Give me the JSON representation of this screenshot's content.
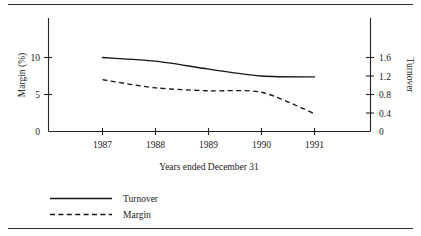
{
  "chart_data": {
    "type": "line",
    "title": "",
    "xlabel": "Years ended December 31",
    "categories": [
      "1987",
      "1988",
      "1989",
      "1990",
      "1991"
    ],
    "grid": false,
    "legend_position": "bottom-left",
    "axes": {
      "left": {
        "label": "Margin (%)",
        "ticks": [
          "0",
          "5",
          "10"
        ],
        "tick_values": [
          0,
          5,
          10
        ],
        "ylim": [
          0,
          12.5
        ],
        "orientation": "rotated-ccw"
      },
      "right": {
        "label": "Turnover",
        "ticks": [
          "0",
          "0.4",
          "0.8",
          "1.2",
          "1.6"
        ],
        "tick_values": [
          0,
          0.4,
          0.8,
          1.2,
          1.6
        ],
        "ylim": [
          0,
          2.0
        ],
        "orientation": "rotated-cw"
      }
    },
    "series": [
      {
        "name": "Turnover",
        "axis": "right",
        "style": "solid",
        "values": [
          1.6,
          1.52,
          1.35,
          1.2,
          1.18
        ]
      },
      {
        "name": "Margin",
        "axis": "left",
        "style": "dashed",
        "values": [
          7.0,
          5.9,
          5.5,
          5.3,
          2.4
        ]
      }
    ]
  },
  "legend": {
    "entries": [
      {
        "label": "Turnover",
        "style": "solid"
      },
      {
        "label": "Margin",
        "style": "dashed"
      }
    ]
  },
  "colors": {
    "ink": "#151515",
    "rule": "#2b2b2b",
    "background": "#ffffff"
  }
}
